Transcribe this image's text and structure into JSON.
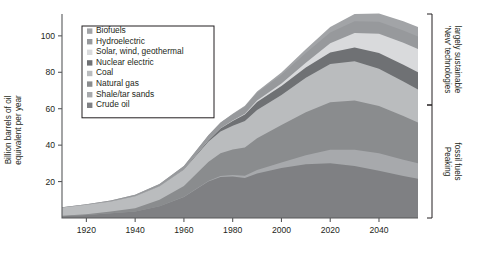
{
  "chart_data": {
    "type": "area",
    "stacked": true,
    "title": "",
    "xlabel": "",
    "ylabel": "Billion barrels of oil equivalent per year",
    "xlim": [
      1910,
      2056
    ],
    "ylim": [
      0,
      112
    ],
    "xticks": [
      1920,
      1940,
      1960,
      1980,
      2000,
      2020,
      2040
    ],
    "yticks": [
      20,
      40,
      60,
      80,
      100
    ],
    "grid": false,
    "legend_position": "top-left",
    "x": [
      1910,
      1920,
      1930,
      1940,
      1950,
      1960,
      1970,
      1975,
      1980,
      1985,
      1990,
      2000,
      2010,
      2020,
      2030,
      2040,
      2050,
      2056
    ],
    "series": [
      {
        "name": "Crude oil",
        "color": "#7f8083",
        "values": [
          1.0,
          1.6,
          2.6,
          3.6,
          6.5,
          11.5,
          20.0,
          22.5,
          22.8,
          22.0,
          24.5,
          27.5,
          29.5,
          30.0,
          28.5,
          26.0,
          23.0,
          21.5
        ]
      },
      {
        "name": "Shale/tar sands",
        "color": "#a7a9ac",
        "values": [
          0.0,
          0.0,
          0.0,
          0.0,
          0.0,
          0.1,
          0.3,
          0.5,
          0.8,
          1.2,
          1.8,
          3.0,
          5.0,
          7.5,
          9.0,
          9.5,
          9.0,
          8.5
        ]
      },
      {
        "name": "Natural gas",
        "color": "#8a8c8e",
        "values": [
          0.2,
          0.5,
          1.0,
          1.8,
          3.5,
          6.0,
          10.5,
          12.5,
          14.0,
          15.5,
          17.5,
          20.5,
          23.5,
          26.0,
          27.0,
          26.0,
          24.0,
          22.5
        ]
      },
      {
        "name": "Coal",
        "color": "#babcbe",
        "values": [
          4.5,
          5.2,
          5.5,
          6.5,
          7.5,
          9.0,
          11.0,
          12.0,
          13.0,
          14.5,
          15.5,
          16.5,
          19.0,
          21.0,
          21.5,
          20.5,
          19.0,
          18.0
        ]
      },
      {
        "name": "Nuclear electric",
        "color": "#6f7174",
        "values": [
          0.0,
          0.0,
          0.0,
          0.0,
          0.0,
          0.2,
          0.8,
          1.6,
          2.6,
          3.6,
          4.4,
          5.0,
          5.6,
          6.4,
          7.6,
          8.6,
          9.2,
          9.5
        ]
      },
      {
        "name": "Solar, wind, geothermal",
        "color": "#d9dadc",
        "values": [
          0.0,
          0.0,
          0.0,
          0.0,
          0.0,
          0.0,
          0.1,
          0.2,
          0.3,
          0.5,
          0.8,
          1.4,
          2.6,
          5.0,
          8.0,
          10.5,
          12.0,
          12.8
        ]
      },
      {
        "name": "Hydroelectric",
        "color": "#97999c",
        "values": [
          0.2,
          0.3,
          0.5,
          0.8,
          1.2,
          1.8,
          2.6,
          3.0,
          3.4,
          3.8,
          4.2,
          4.8,
          5.4,
          6.0,
          6.4,
          6.6,
          6.8,
          6.8
        ]
      },
      {
        "name": "Biofuels",
        "color": "#a2a4a7",
        "values": [
          0.0,
          0.0,
          0.0,
          0.0,
          0.0,
          0.0,
          0.1,
          0.2,
          0.3,
          0.5,
          0.8,
          1.2,
          2.0,
          3.0,
          4.0,
          4.6,
          5.0,
          5.2
        ]
      }
    ]
  },
  "legend": {
    "items": [
      {
        "label": "Biofuels",
        "color": "#a2a4a7"
      },
      {
        "label": "Hydroelectric",
        "color": "#97999c"
      },
      {
        "label": "Solar, wind, geothermal",
        "color": "#d9dadc"
      },
      {
        "label": "Nuclear electric",
        "color": "#6f7174"
      },
      {
        "label": "Coal",
        "color": "#babcbe"
      },
      {
        "label": "Natural gas",
        "color": "#8a8c8e"
      },
      {
        "label": "Shale/tar sands",
        "color": "#a7a9ac"
      },
      {
        "label": "Crude oil",
        "color": "#7f8083"
      }
    ]
  },
  "annotations": {
    "brackets": [
      {
        "label_line1": "'New' technologies",
        "label_line2": "largely sustainable"
      },
      {
        "label_line1": "Peaking",
        "label_line2": "fossil fuels"
      }
    ]
  },
  "axes": {
    "y_title_line1": "Billion barrels of oil",
    "y_title_line2": "equivalent per year"
  }
}
